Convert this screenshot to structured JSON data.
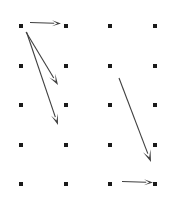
{
  "canvas": {
    "width": 176,
    "height": 197,
    "background": "#ffffff",
    "title": "Dot grid with directional arrows"
  },
  "grid": {
    "label": "dot-grid",
    "columns": 4,
    "rows": 5,
    "column_x": [
      21,
      66,
      110,
      155
    ],
    "row_y": [
      26,
      66,
      105,
      145,
      184
    ],
    "dot_size": 4,
    "dot_color": "#1a1a1a",
    "dots": [
      {
        "id": "r1c1",
        "x": 21,
        "y": 26
      },
      {
        "id": "r1c2",
        "x": 66,
        "y": 26
      },
      {
        "id": "r1c3",
        "x": 110,
        "y": 26
      },
      {
        "id": "r1c4",
        "x": 155,
        "y": 26
      },
      {
        "id": "r2c1",
        "x": 21,
        "y": 66
      },
      {
        "id": "r2c2",
        "x": 66,
        "y": 66
      },
      {
        "id": "r2c3",
        "x": 110,
        "y": 66
      },
      {
        "id": "r2c4",
        "x": 155,
        "y": 66
      },
      {
        "id": "r3c1",
        "x": 21,
        "y": 105
      },
      {
        "id": "r3c2",
        "x": 66,
        "y": 105
      },
      {
        "id": "r3c3",
        "x": 110,
        "y": 105
      },
      {
        "id": "r3c4",
        "x": 155,
        "y": 105
      },
      {
        "id": "r4c1",
        "x": 21,
        "y": 145
      },
      {
        "id": "r4c2",
        "x": 66,
        "y": 145
      },
      {
        "id": "r4c3",
        "x": 110,
        "y": 145
      },
      {
        "id": "r4c4",
        "x": 155,
        "y": 145
      },
      {
        "id": "r5c1",
        "x": 21,
        "y": 184
      },
      {
        "id": "r5c2",
        "x": 66,
        "y": 184
      },
      {
        "id": "r5c3",
        "x": 110,
        "y": 184
      },
      {
        "id": "r5c4",
        "x": 155,
        "y": 184
      }
    ]
  },
  "arrows": {
    "stroke_color": "#3f3f3f",
    "stroke_width": 1.1,
    "items": [
      {
        "id": "arrow-top-horizontal",
        "name": "arrow-top-horizontal",
        "direction": "right",
        "x1": 30,
        "y1": 22.5,
        "x2": 61,
        "y2": 23.5,
        "head_length": 9,
        "head_width": 6
      },
      {
        "id": "arrow-upper-left-diagonal-short",
        "name": "arrow-upper-left-diagonal-short",
        "direction": "down-right",
        "x1": 26,
        "y1": 32,
        "x2": 58,
        "y2": 85,
        "head_length": 11,
        "head_width": 7
      },
      {
        "id": "arrow-upper-left-diagonal-long",
        "name": "arrow-upper-left-diagonal-long",
        "direction": "down-right",
        "x1": 26.5,
        "y1": 32,
        "x2": 58,
        "y2": 125,
        "head_length": 11,
        "head_width": 7
      },
      {
        "id": "arrow-right-diagonal",
        "name": "arrow-right-diagonal",
        "direction": "down-right",
        "x1": 119,
        "y1": 78,
        "x2": 151,
        "y2": 162,
        "head_length": 12,
        "head_width": 8
      },
      {
        "id": "arrow-bottom-horizontal",
        "name": "arrow-bottom-horizontal",
        "direction": "right",
        "x1": 122,
        "y1": 181.5,
        "x2": 153,
        "y2": 182.5,
        "head_length": 9,
        "head_width": 6
      }
    ]
  }
}
